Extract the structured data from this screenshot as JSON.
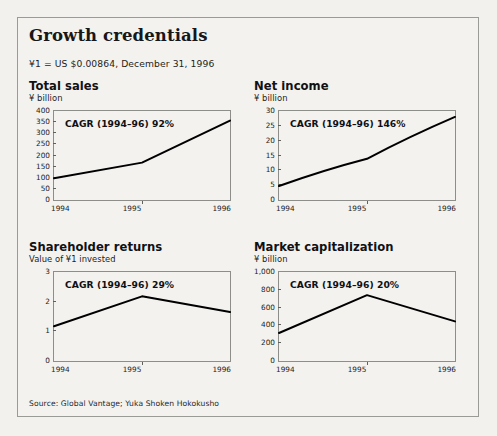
{
  "exhibit": {
    "title": "Growth credentials",
    "fx_note": "¥1 = US $0.00864, December 31, 1996",
    "source": "Source: Global Vantage; Yuka Shoken Hokokusho"
  },
  "chart_data": [
    {
      "type": "line",
      "title": "Total sales",
      "subtitle": "¥ billion",
      "ylabel": "¥ billion",
      "xlabel": "",
      "annotation": "CAGR (1994–96) 92%",
      "categories": [
        "1994",
        "1995",
        "1996"
      ],
      "x": [
        1994,
        1995,
        1996
      ],
      "values": [
        98,
        168,
        357
      ],
      "yticks": [
        "400",
        "350",
        "300",
        "250",
        "200",
        "150",
        "100",
        "50",
        "0"
      ],
      "ytick_values": [
        400,
        350,
        300,
        250,
        200,
        150,
        100,
        50,
        0
      ],
      "ylim": [
        0,
        400
      ],
      "grid": false,
      "legend": "none",
      "line_color": "#000000"
    },
    {
      "type": "line",
      "title": "Net income",
      "subtitle": "¥ billion",
      "ylabel": "¥ billion",
      "xlabel": "",
      "annotation": "CAGR (1994–96) 146%",
      "categories": [
        "1994",
        "1995",
        "1996"
      ],
      "x": [
        1994,
        1995,
        1996
      ],
      "values": [
        4.7,
        13.9,
        28.0
      ],
      "yticks": [
        "30",
        "25",
        "20",
        "15",
        "10",
        "5",
        "0"
      ],
      "ytick_values": [
        30,
        25,
        20,
        15,
        10,
        5,
        0
      ],
      "ylim": [
        0,
        30
      ],
      "grid": false,
      "legend": "none",
      "line_color": "#000000"
    },
    {
      "type": "line",
      "title": "Shareholder returns",
      "subtitle": "Value of ¥1 invested",
      "ylabel": "Value of ¥1 invested",
      "xlabel": "",
      "annotation": "CAGR (1994–96) 29%",
      "categories": [
        "1994",
        "1995",
        "1996"
      ],
      "x": [
        1994,
        1995,
        1996
      ],
      "values": [
        1.17,
        2.18,
        1.65
      ],
      "yticks": [
        "3",
        "2",
        "1",
        "0"
      ],
      "ytick_values": [
        3,
        2,
        1,
        0
      ],
      "ylim": [
        0,
        3
      ],
      "grid": false,
      "legend": "none",
      "line_color": "#000000"
    },
    {
      "type": "line",
      "title": "Market capitalization",
      "subtitle": "¥ billion",
      "ylabel": "¥ billion",
      "xlabel": "",
      "annotation": "CAGR (1994–96) 20%",
      "categories": [
        "1994",
        "1995",
        "1996"
      ],
      "x": [
        1994,
        1995,
        1996
      ],
      "values": [
        315,
        740,
        445
      ],
      "yticks": [
        "1,000",
        "800",
        "600",
        "400",
        "200",
        "0"
      ],
      "ytick_values": [
        1000,
        800,
        600,
        400,
        200,
        0
      ],
      "ylim": [
        0,
        1000
      ],
      "grid": false,
      "legend": "none",
      "line_color": "#000000"
    }
  ]
}
